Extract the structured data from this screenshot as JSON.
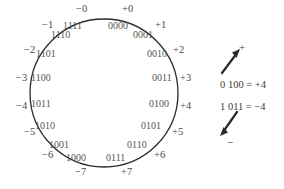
{
  "figure": {
    "type": "number-wheel",
    "circle": {
      "cx": 104,
      "cy": 93,
      "r": 74,
      "stroke": "#2b2b2b"
    },
    "text_color": "#4a4a4a"
  },
  "wheel": {
    "nodes": [
      {
        "decimal": "+0",
        "binary": "0000",
        "dec_x": 122,
        "dec_y": 4,
        "bin_x": 108,
        "bin_y": 21
      },
      {
        "decimal": "+1",
        "binary": "0001",
        "dec_x": 155,
        "dec_y": 20,
        "bin_x": 133,
        "bin_y": 30
      },
      {
        "decimal": "+2",
        "binary": "0010",
        "dec_x": 173,
        "dec_y": 45,
        "bin_x": 147,
        "bin_y": 49
      },
      {
        "decimal": "+3",
        "binary": "0011",
        "dec_x": 180,
        "dec_y": 73,
        "bin_x": 152,
        "bin_y": 73
      },
      {
        "decimal": "+4",
        "binary": "0100",
        "dec_x": 180,
        "dec_y": 101,
        "bin_x": 149,
        "bin_y": 99
      },
      {
        "decimal": "+5",
        "binary": "0101",
        "dec_x": 172,
        "dec_y": 127,
        "bin_x": 141,
        "bin_y": 121
      },
      {
        "decimal": "+6",
        "binary": "0110",
        "dec_x": 154,
        "dec_y": 150,
        "bin_x": 127,
        "bin_y": 140
      },
      {
        "decimal": "+7",
        "binary": "0111",
        "dec_x": 121,
        "dec_y": 167,
        "bin_x": 106,
        "bin_y": 153
      },
      {
        "decimal": "−7",
        "binary": "1000",
        "dec_x": 75,
        "dec_y": 167,
        "bin_x": 66,
        "bin_y": 153
      },
      {
        "decimal": "−6",
        "binary": "1001",
        "dec_x": 42,
        "dec_y": 150,
        "bin_x": 49,
        "bin_y": 140
      },
      {
        "decimal": "−5",
        "binary": "1010",
        "dec_x": 24,
        "dec_y": 127,
        "bin_x": 35,
        "bin_y": 121
      },
      {
        "decimal": "−4",
        "binary": "1011",
        "dec_x": 16,
        "dec_y": 101,
        "bin_x": 31,
        "bin_y": 99
      },
      {
        "decimal": "−3",
        "binary": "1100",
        "dec_x": 16,
        "dec_y": 73,
        "bin_x": 31,
        "bin_y": 73
      },
      {
        "decimal": "−2",
        "binary": "1101",
        "dec_x": 24,
        "dec_y": 45,
        "bin_x": 36,
        "bin_y": 49
      },
      {
        "decimal": "−1",
        "binary": "1110",
        "dec_x": 42,
        "dec_y": 20,
        "bin_x": 51,
        "bin_y": 30
      },
      {
        "decimal": "−0",
        "binary": "1111",
        "dec_x": 76,
        "dec_y": 4,
        "bin_x": 63,
        "bin_y": 21
      }
    ]
  },
  "annotations": {
    "positive_sign": "+",
    "negative_sign": "−",
    "equation_positive": "0 100 = +4",
    "equation_negative": "1 011 = −4"
  }
}
